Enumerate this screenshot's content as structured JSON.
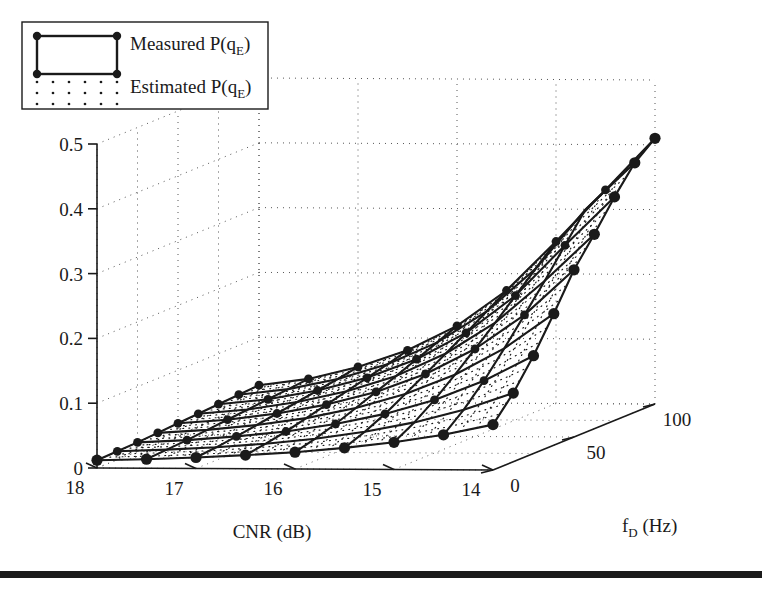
{
  "figure": {
    "background": "#ffffff",
    "ink": "#1a1a1a",
    "width": 762,
    "height": 592,
    "footer_rule": true
  },
  "legend": {
    "position": "top-left",
    "border": true,
    "items": [
      {
        "label_prefix": "Measured P(q",
        "label_sub": "E",
        "label_suffix": ")",
        "style": "solid-line-with-markers",
        "name": "measured"
      },
      {
        "label_prefix": "Estimated P(q",
        "label_sub": "E",
        "label_suffix": ")",
        "style": "dotted-mesh",
        "name": "estimated"
      }
    ]
  },
  "chart_data": {
    "type": "line",
    "render": "3d-surface-mesh",
    "title": "",
    "xlabel_prefix": "CNR (dB)",
    "ylabel_prefix": "f",
    "ylabel_sub": "D",
    "ylabel_suffix": " (Hz)",
    "zlabel": "",
    "xlabel": "CNR (dB)",
    "ylabel": "f_D (Hz)",
    "x_ticks": [
      18,
      17,
      16,
      15,
      14
    ],
    "x_tick_labels": [
      "18",
      "17",
      "16",
      "15",
      "14"
    ],
    "xlim": [
      18,
      14
    ],
    "y_ticks": [
      0,
      50,
      100
    ],
    "y_tick_labels": [
      "0",
      "50",
      "100"
    ],
    "ylim": [
      0,
      100
    ],
    "z_ticks": [
      0,
      0.1,
      0.2,
      0.3,
      0.4,
      0.5
    ],
    "z_tick_labels": [
      "0",
      "0.1",
      "0.2",
      "0.3",
      "0.4",
      "0.5"
    ],
    "zlim": [
      0,
      0.5
    ],
    "grid": "dotted-back-walls",
    "legend_position": "top-left",
    "x_values": [
      18,
      17.5,
      17,
      16.5,
      16,
      15.5,
      15,
      14.5,
      14
    ],
    "y_values": [
      0,
      12.5,
      25,
      37.5,
      50,
      62.5,
      75,
      87.5,
      100
    ],
    "series": [
      {
        "name": "CNR=18",
        "values": [
          0.012,
          0.013,
          0.014,
          0.016,
          0.018,
          0.02,
          0.022,
          0.024,
          0.026
        ]
      },
      {
        "name": "CNR=17.5",
        "values": [
          0.014,
          0.016,
          0.018,
          0.021,
          0.024,
          0.027,
          0.03,
          0.033,
          0.036
        ]
      },
      {
        "name": "CNR=17",
        "values": [
          0.017,
          0.02,
          0.024,
          0.029,
          0.034,
          0.039,
          0.044,
          0.049,
          0.055
        ]
      },
      {
        "name": "CNR=16.5",
        "values": [
          0.021,
          0.026,
          0.032,
          0.04,
          0.048,
          0.056,
          0.064,
          0.072,
          0.081
        ]
      },
      {
        "name": "CNR=16",
        "values": [
          0.026,
          0.034,
          0.044,
          0.056,
          0.068,
          0.08,
          0.093,
          0.106,
          0.119
        ]
      },
      {
        "name": "CNR=15.5",
        "values": [
          0.033,
          0.045,
          0.06,
          0.078,
          0.096,
          0.115,
          0.134,
          0.154,
          0.174
        ]
      },
      {
        "name": "CNR=15",
        "values": [
          0.042,
          0.06,
          0.082,
          0.108,
          0.135,
          0.163,
          0.192,
          0.221,
          0.25
        ]
      },
      {
        "name": "CNR=14.5",
        "values": [
          0.054,
          0.08,
          0.112,
          0.149,
          0.188,
          0.228,
          0.27,
          0.312,
          0.33
        ]
      },
      {
        "name": "CNR=14",
        "values": [
          0.07,
          0.106,
          0.151,
          0.203,
          0.258,
          0.3,
          0.345,
          0.385,
          0.41
        ]
      }
    ],
    "estimated_offset": 0.0
  }
}
